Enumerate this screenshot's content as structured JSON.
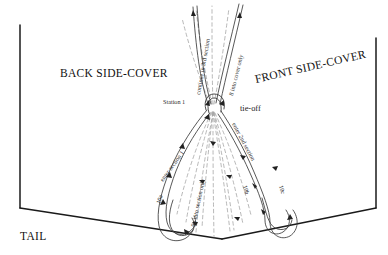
{
  "diagram": {
    "title_labels": {
      "back_side_cover": "BACK SIDE-COVER",
      "front_side_cover": "FRONT SIDE-COVER",
      "tail": "TAIL"
    },
    "station_label": "Station 1",
    "tieoff_label": "tie-off",
    "thread_path_labels": {
      "continue_3rd": "continue in 3rd section",
      "into_cover_only": "8 into cover only",
      "enter_section_1": "enter section 1",
      "into_section_only": "9a into section only",
      "enter_2nd_section": "enter 2nd section",
      "step_10a": "10a",
      "step_10b": "10b",
      "step_10c": "10c"
    },
    "colors": {
      "book_outline": "#1a1a1a",
      "thread_solid": "#3a3a3a",
      "thread_dashed": "#8a8a8a",
      "text": "#1a1a1a"
    }
  }
}
